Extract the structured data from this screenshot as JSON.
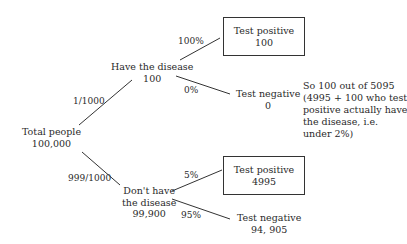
{
  "diagram": {
    "type": "probability-tree",
    "root": {
      "label": "Total people",
      "value": "100,000"
    },
    "branches": [
      {
        "probability": "1/1000",
        "node": {
          "label": "Have the disease",
          "value": "100"
        },
        "outcomes": [
          {
            "probability": "100%",
            "label": "Test positive",
            "value": "100",
            "boxed": true
          },
          {
            "probability": "0%",
            "label": "Test negative",
            "value": "0",
            "boxed": false
          }
        ]
      },
      {
        "probability": "999/1000",
        "node": {
          "label_line1": "Don't have",
          "label_line2": "the disease",
          "value": "99,900"
        },
        "outcomes": [
          {
            "probability": "5%",
            "label": "Test positive",
            "value": "4995",
            "boxed": true
          },
          {
            "probability": "95%",
            "label": "Test negative",
            "value": "94, 905",
            "boxed": false
          }
        ]
      }
    ],
    "note": {
      "lines": [
        "So 100 out of 5095",
        "(4995 + 100 who test",
        "positive actually have",
        "the disease, i.e.",
        "under 2%)"
      ]
    },
    "colors": {
      "line": "#333333",
      "text": "#2a2a2a",
      "background": "#ffffff"
    }
  }
}
